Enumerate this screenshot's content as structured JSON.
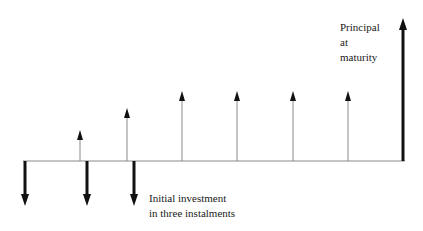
{
  "diagram": {
    "type": "cash-flow-timeline",
    "labels": {
      "principal": [
        "Principal",
        "at",
        "maturity"
      ],
      "initial": [
        "Initial investment",
        "in three instalments"
      ]
    },
    "baseline": {
      "x1": 23,
      "x2": 405,
      "y": 161
    },
    "outflows": [
      {
        "x": 25,
        "tip_y": 206
      },
      {
        "x": 87,
        "tip_y": 206
      },
      {
        "x": 134,
        "tip_y": 206
      }
    ],
    "coupons": [
      {
        "x": 80,
        "tip_y": 130
      },
      {
        "x": 127,
        "tip_y": 108
      },
      {
        "x": 182,
        "tip_y": 91
      },
      {
        "x": 237,
        "tip_y": 91
      },
      {
        "x": 293,
        "tip_y": 91
      },
      {
        "x": 348,
        "tip_y": 91
      }
    ],
    "principal": {
      "x": 403,
      "tip_y": 18
    },
    "colors": {
      "line": "#8a8a8a",
      "thick": "#111111"
    }
  }
}
